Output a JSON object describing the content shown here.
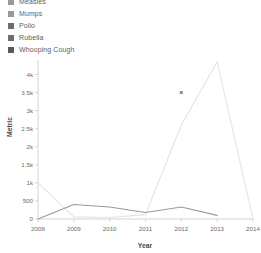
{
  "legend": {
    "items": [
      {
        "label": "Measles",
        "color": "#9a9a9a"
      },
      {
        "label": "Mumps",
        "color": "#9a9a9a"
      },
      {
        "label": "Polio",
        "color": "#6e6e6e"
      },
      {
        "label": "Rubella",
        "color": "#6e6e6e"
      },
      {
        "label": "Whooping Cough",
        "color": "#5a5a5a"
      }
    ]
  },
  "chart_data": {
    "type": "line",
    "title": "",
    "xlabel": "Year",
    "ylabel": "Metric",
    "x": [
      2008,
      2009,
      2010,
      2011,
      2012,
      2013,
      2014
    ],
    "xlim": [
      2008,
      2014
    ],
    "ylim": [
      0,
      4400
    ],
    "grid": false,
    "legend_position": "top-left",
    "y_ticks": [
      0,
      500,
      1000,
      1500,
      2000,
      2500,
      3000,
      3500,
      4000
    ],
    "y_tick_labels": [
      "0",
      "500",
      "1k",
      "1.5k",
      "2k",
      "2.5k",
      "3k",
      "3.5k",
      "4k"
    ],
    "x_tick_labels": [
      "2008",
      "2009",
      "2010",
      "2011",
      "2012",
      "2013",
      "2014"
    ],
    "series": [
      {
        "name": "Measles",
        "color": "#e3e3e3",
        "values": [
          1000,
          60,
          40,
          120,
          2600,
          4350,
          0
        ],
        "markers": []
      },
      {
        "name": "Whooping Cough",
        "color": "#9a9a9a",
        "values": [
          0,
          400,
          330,
          180,
          330,
          100,
          null
        ],
        "markers": [
          {
            "x": 2012,
            "y": 3500
          }
        ]
      }
    ],
    "annotations": [
      {
        "label": "marker-point",
        "x": 2012,
        "y": 3500,
        "color": "#8f8f8f"
      }
    ]
  }
}
